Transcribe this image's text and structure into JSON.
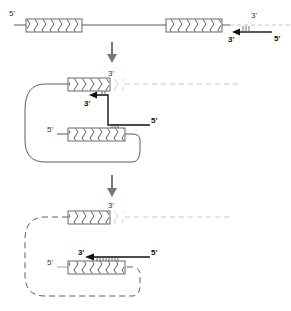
{
  "diagram": {
    "type": "molecular-biology-schematic",
    "colors": {
      "line": "#333333",
      "faded": "#bbbbbb",
      "arrow_down": "#777777",
      "primer": "#111111"
    },
    "panels": [
      {
        "id": "panel-1",
        "labels": {
          "left_5prime": "5'",
          "right_3prime": "3'",
          "primer_3prime": "3'",
          "primer_5prime": "5'"
        }
      },
      {
        "id": "panel-2",
        "labels": {
          "top_3prime": "3'",
          "primer_3prime": "3'",
          "primer_5prime": "5'",
          "bottom_5prime": "5'"
        }
      },
      {
        "id": "panel-3",
        "labels": {
          "top_3prime": "3'",
          "primer_3prime": "3'",
          "primer_5prime": "5'",
          "bottom_5prime": "5'"
        }
      }
    ],
    "step_arrows": [
      {
        "id": "step-arrow-1",
        "direction": "down"
      },
      {
        "id": "step-arrow-2",
        "direction": "down"
      }
    ]
  }
}
